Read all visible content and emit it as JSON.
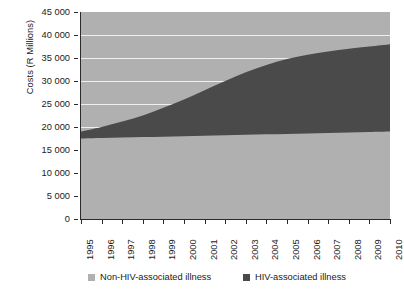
{
  "chart_data": {
    "type": "area",
    "stacked": true,
    "title": "",
    "xlabel": "",
    "ylabel": "Costs (R Millions)",
    "ylim": [
      0,
      45000
    ],
    "ytick_step": 5000,
    "ytick_labels": [
      "45 000",
      "40 000",
      "35 000",
      "30 000",
      "25 000",
      "20 000",
      "15 000",
      "10 000",
      "5 000",
      "0"
    ],
    "ytick_values": [
      45000,
      40000,
      35000,
      30000,
      25000,
      20000,
      15000,
      10000,
      5000,
      0
    ],
    "grid": true,
    "grid_color": "#f2f2f2",
    "plot_background": "#b0b0b0",
    "legend_position": "bottom",
    "categories": [
      "1995",
      "1996",
      "1997",
      "1998",
      "1999",
      "2000",
      "2001",
      "2002",
      "2003",
      "2004",
      "2005",
      "2006",
      "2007",
      "2008",
      "2009",
      "2010"
    ],
    "x": [
      1995,
      1996,
      1997,
      1998,
      1999,
      2000,
      2001,
      2002,
      2003,
      2004,
      2005,
      2006,
      2007,
      2008,
      2009,
      2010
    ],
    "series": [
      {
        "name": "Non-HIV-associated illness",
        "color": "#b0b0b0",
        "values": [
          17500,
          17600,
          17700,
          17800,
          17900,
          18000,
          18100,
          18200,
          18300,
          18400,
          18500,
          18600,
          18700,
          18800,
          18900,
          19000
        ]
      },
      {
        "name": "HIV-associated illness",
        "color": "#4a4a4a",
        "values": [
          1500,
          2400,
          3500,
          4700,
          6300,
          8000,
          9900,
          11800,
          13600,
          15100,
          16300,
          17100,
          17700,
          18200,
          18600,
          19000
        ]
      }
    ],
    "cumulative_totals": [
      19000,
      20000,
      21200,
      22500,
      24200,
      26000,
      28000,
      30000,
      31900,
      33500,
      34800,
      35700,
      36400,
      37000,
      37500,
      38000
    ]
  },
  "legend": {
    "items": [
      {
        "label": "Non-HIV-associated illness",
        "color": "#b0b0b0"
      },
      {
        "label": "HIV-associated illness",
        "color": "#4a4a4a"
      }
    ]
  }
}
